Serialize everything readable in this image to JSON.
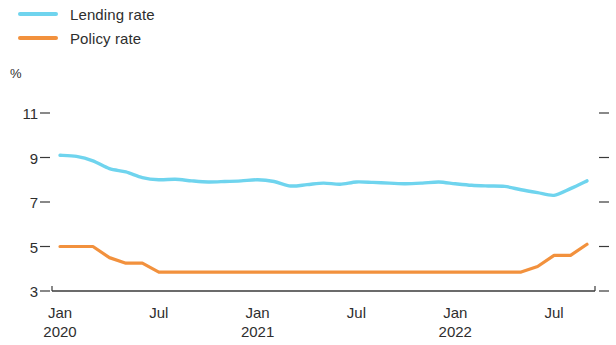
{
  "legend": {
    "items": [
      {
        "label": "Lending rate",
        "color": "#6FD4EE",
        "name": "lending-rate"
      },
      {
        "label": "Policy rate",
        "color": "#F2913D",
        "name": "policy-rate"
      }
    ]
  },
  "axis": {
    "unit": "%",
    "y_ticks": [
      "11",
      "9",
      "7",
      "5",
      "3"
    ],
    "x_ticks": [
      {
        "month": "Jan",
        "year": "2020"
      },
      {
        "month": "Jul",
        "year": ""
      },
      {
        "month": "Jan",
        "year": "2021"
      },
      {
        "month": "Jul",
        "year": ""
      },
      {
        "month": "Jan",
        "year": "2022"
      },
      {
        "month": "Jul",
        "year": ""
      }
    ]
  },
  "chart_data": {
    "type": "line",
    "title": "",
    "subtitle": "",
    "xlabel": "",
    "ylabel": "%",
    "ylim": [
      3,
      11
    ],
    "yticks": [
      3,
      5,
      7,
      9,
      11
    ],
    "grid": false,
    "legend_position": "top-left",
    "x": [
      "2020-01",
      "2020-02",
      "2020-03",
      "2020-04",
      "2020-05",
      "2020-06",
      "2020-07",
      "2020-08",
      "2020-09",
      "2020-10",
      "2020-11",
      "2020-12",
      "2021-01",
      "2021-02",
      "2021-03",
      "2021-04",
      "2021-05",
      "2021-06",
      "2021-07",
      "2021-08",
      "2021-09",
      "2021-10",
      "2021-11",
      "2021-12",
      "2022-01",
      "2022-02",
      "2022-03",
      "2022-04",
      "2022-05",
      "2022-06",
      "2022-07",
      "2022-08",
      "2022-09"
    ],
    "x_tick_labels": [
      "Jan 2020",
      "Jul",
      "Jan 2021",
      "Jul",
      "Jan 2022",
      "Jul"
    ],
    "series": [
      {
        "name": "Lending rate",
        "color": "#6FD4EE",
        "values": [
          9.1,
          9.05,
          8.85,
          8.5,
          8.35,
          8.1,
          8.0,
          8.02,
          7.95,
          7.9,
          7.92,
          7.95,
          8.0,
          7.92,
          7.72,
          7.78,
          7.85,
          7.8,
          7.9,
          7.88,
          7.85,
          7.82,
          7.85,
          7.9,
          7.82,
          7.75,
          7.72,
          7.7,
          7.55,
          7.42,
          7.3,
          7.6,
          7.95
        ]
      },
      {
        "name": "Policy rate",
        "color": "#F2913D",
        "values": [
          5.0,
          5.0,
          5.0,
          4.5,
          4.25,
          4.25,
          3.85,
          3.85,
          3.85,
          3.85,
          3.85,
          3.85,
          3.85,
          3.85,
          3.85,
          3.85,
          3.85,
          3.85,
          3.85,
          3.85,
          3.85,
          3.85,
          3.85,
          3.85,
          3.85,
          3.85,
          3.85,
          3.85,
          3.85,
          4.1,
          4.6,
          4.6,
          5.1
        ]
      }
    ]
  },
  "geometry": {
    "plot_left": 52,
    "plot_right": 595,
    "y_top_value": 11,
    "y_top_px": 113,
    "y_bottom_value": 3,
    "y_bottom_px": 291
  }
}
